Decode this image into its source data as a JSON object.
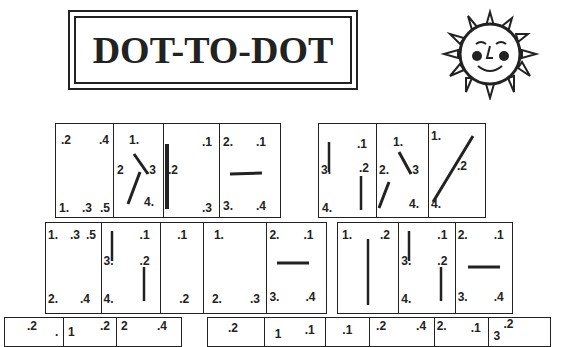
{
  "title": "DOT-TO-DOT",
  "decoration": {
    "icon": "sun-face-icon"
  },
  "puzzle_rows": [
    {
      "name": "row-1-left",
      "cells": [
        {
          "labels": [
            ".2",
            ".4",
            "1.",
            ".3",
            ".5"
          ]
        },
        {
          "labels": [
            "1.",
            "2",
            ".3",
            "4."
          ]
        },
        {
          "labels": [
            ".1",
            ".2",
            ".3"
          ]
        },
        {
          "labels": [
            "2.",
            ".1",
            "3.",
            ".4"
          ]
        }
      ]
    },
    {
      "name": "row-1-right",
      "cells": [
        {
          "labels": [
            ".1",
            "3.",
            ".2",
            "4."
          ]
        },
        {
          "labels": [
            "1.",
            "2.",
            ".3",
            "4."
          ]
        },
        {
          "labels": [
            "1.",
            ".2",
            "4."
          ]
        }
      ]
    },
    {
      "name": "row-2-left",
      "cells": [
        {
          "labels": [
            "1.",
            ".3",
            ".5",
            "2.",
            ".4"
          ]
        },
        {
          "labels": [
            ".1",
            "3.",
            ".2",
            "4."
          ]
        },
        {
          "labels": [
            ".1",
            ".2"
          ]
        },
        {
          "labels": [
            "1.",
            "2.",
            ".3"
          ]
        },
        {
          "labels": [
            "2.",
            ".1",
            "3.",
            ".4"
          ]
        }
      ]
    },
    {
      "name": "row-2-right",
      "cells": [
        {
          "labels": [
            "1.",
            ".2"
          ]
        },
        {
          "labels": [
            ".1",
            "3.",
            ".2",
            "4."
          ]
        },
        {
          "labels": [
            "2.",
            ".1",
            "3.",
            ".4"
          ]
        }
      ]
    },
    {
      "name": "row-3-left",
      "cells": [
        {
          "labels": [
            ".2",
            "."
          ]
        },
        {
          "labels": [
            "1",
            ".2"
          ]
        },
        {
          "labels": [
            "2",
            ".4"
          ]
        }
      ]
    },
    {
      "name": "row-3-right",
      "cells": [
        {
          "labels": [
            ".2"
          ]
        },
        {
          "labels": [
            "1",
            ".1"
          ]
        },
        {
          "labels": [
            ".1"
          ]
        },
        {
          "labels": [
            ".2",
            ".4"
          ]
        },
        {
          "labels": [
            "2.",
            ".1"
          ]
        },
        {
          "labels": [
            ".2",
            "3"
          ]
        }
      ]
    }
  ]
}
